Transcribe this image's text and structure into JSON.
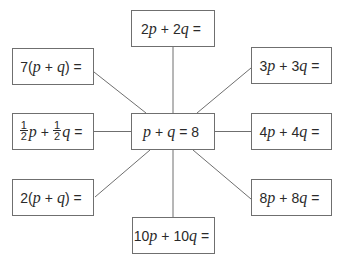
{
  "diagram": {
    "type": "spider-diagram",
    "center": {
      "label": "p + q = 8",
      "parts": {
        "p": "p",
        "plus": "+",
        "q": "q",
        "eq": "= 8"
      }
    },
    "nodes": [
      {
        "id": "top",
        "label": "2p + 2q =",
        "parts": {
          "c1": "2",
          "p": "p",
          "plus": "+",
          "c2": "2",
          "q": "q",
          "eq": "="
        }
      },
      {
        "id": "top-left",
        "label": "7(p + q) =",
        "parts": {
          "c1": "7(",
          "p": "p",
          "plus": "+",
          "q": "q",
          "close": ")",
          "eq": "="
        }
      },
      {
        "id": "top-right",
        "label": "3p + 3q =",
        "parts": {
          "c1": "3",
          "p": "p",
          "plus": "+",
          "c2": "3",
          "q": "q",
          "eq": "="
        }
      },
      {
        "id": "mid-left",
        "label": "1/2p + 1/2q =",
        "parts": {
          "num1": "1",
          "den1": "2",
          "p": "p",
          "plus": "+",
          "num2": "1",
          "den2": "2",
          "q": "q",
          "eq": "="
        }
      },
      {
        "id": "mid-right",
        "label": "4p + 4q =",
        "parts": {
          "c1": "4",
          "p": "p",
          "plus": "+",
          "c2": "4",
          "q": "q",
          "eq": "="
        }
      },
      {
        "id": "bottom-left",
        "label": "2(p + q) =",
        "parts": {
          "c1": "2(",
          "p": "p",
          "plus": "+",
          "q": "q",
          "close": ")",
          "eq": "="
        }
      },
      {
        "id": "bottom-right",
        "label": "8p + 8q =",
        "parts": {
          "c1": "8",
          "p": "p",
          "plus": "+",
          "c2": "8",
          "q": "q",
          "eq": "="
        }
      },
      {
        "id": "bottom",
        "label": "10p + 10q =",
        "parts": {
          "c1": "10",
          "p": "p",
          "plus": "+",
          "c2": "10",
          "q": "q",
          "eq": "="
        }
      }
    ],
    "colors": {
      "border": "#6f6f6f",
      "line": "#6f6f6f",
      "text": "#2a2a2a",
      "background": "#ffffff"
    }
  }
}
